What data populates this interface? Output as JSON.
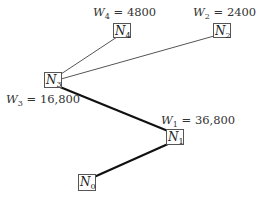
{
  "diagram": {
    "nodes": [
      {
        "id": "N0",
        "letter": "N",
        "sub": "0"
      },
      {
        "id": "N1",
        "letter": "N",
        "sub": "1"
      },
      {
        "id": "N2",
        "letter": "N",
        "sub": "2"
      },
      {
        "id": "N3",
        "letter": "N",
        "sub": "3"
      },
      {
        "id": "N4",
        "letter": "N",
        "sub": "4"
      }
    ],
    "edges": [
      {
        "from": "N3",
        "to": "N4",
        "style": "thin"
      },
      {
        "from": "N3",
        "to": "N2",
        "style": "thin"
      },
      {
        "from": "N3",
        "to": "N1",
        "style": "thick"
      },
      {
        "from": "N1",
        "to": "N0",
        "style": "thick"
      }
    ],
    "weights": [
      {
        "node": "N4",
        "letter": "W",
        "sub": "4",
        "value": "4800"
      },
      {
        "node": "N2",
        "letter": "W",
        "sub": "2",
        "value": "2400"
      },
      {
        "node": "N3",
        "letter": "W",
        "sub": "3",
        "value": "16,800"
      },
      {
        "node": "N1",
        "letter": "W",
        "sub": "1",
        "value": "36,800"
      }
    ]
  }
}
